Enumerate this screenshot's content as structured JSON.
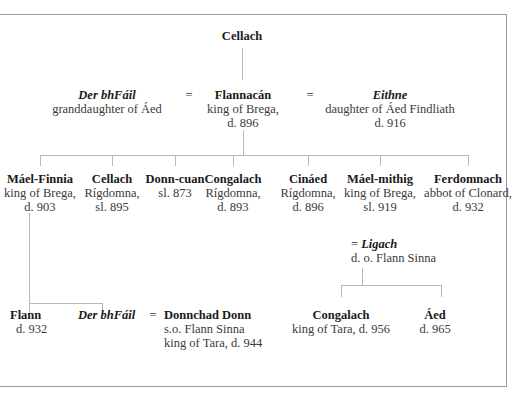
{
  "title_node": {
    "name": "Cellach"
  },
  "generation1": {
    "wife1": {
      "name": "Der bhFáil",
      "desc": [
        "granddaughter of Áed"
      ]
    },
    "eq1": "=",
    "main": {
      "name": "Flannacán",
      "desc": [
        "king of Brega,",
        "d. 896"
      ]
    },
    "eq2": "=",
    "wife2": {
      "name": "Eithne",
      "desc": [
        "daughter of Áed Findliath",
        "d. 916"
      ]
    }
  },
  "generation2": [
    {
      "name": "Máel-Finnia",
      "desc": [
        "king of Brega,",
        "d. 903"
      ]
    },
    {
      "name": "Cellach",
      "desc": [
        "Rígdomna,",
        "sl. 895"
      ]
    },
    {
      "name": "Donn-cuan",
      "desc": [
        "sl. 873"
      ]
    },
    {
      "name": "Congalach",
      "desc": [
        "Rígdomna,",
        "d. 893"
      ]
    },
    {
      "name": "Cináed",
      "desc": [
        "Rígdomna,",
        "d. 896"
      ]
    },
    {
      "name": "Máel-mithig",
      "desc": [
        "king of Brega,",
        "sl. 919"
      ]
    },
    {
      "name": "Ferdomnach",
      "desc": [
        "abbot of Clonard,",
        "d. 932"
      ]
    }
  ],
  "spouse_maelmithig": {
    "eq": "=",
    "name": "Ligach",
    "desc": [
      "d. o. Flann Sinna"
    ]
  },
  "generation3_left": {
    "child1": {
      "name": "Flann",
      "desc": [
        "d. 932"
      ]
    },
    "child2": {
      "name": "Der bhFáil"
    },
    "eq": "=",
    "spouse": {
      "name": "Donnchad Donn",
      "desc": [
        "s.o. Flann Sinna",
        "king of Tara, d. 944"
      ]
    }
  },
  "generation3_right": [
    {
      "name": "Congalach",
      "desc": [
        "king of Tara, d. 956"
      ]
    },
    {
      "name": "Áed",
      "desc": [
        "d. 965"
      ]
    }
  ]
}
